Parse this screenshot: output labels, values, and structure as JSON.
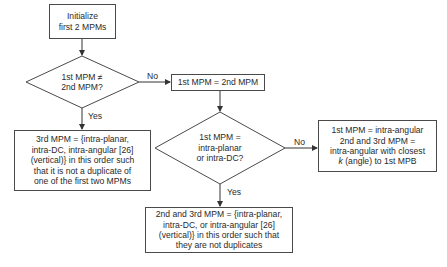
{
  "flowchart": {
    "init_box": {
      "text": "Initialize\nfirst 2 MPMs"
    },
    "decision1": {
      "text": "1st MPM ≠\n2nd MPM?",
      "no_label": "No",
      "yes_label": "Yes"
    },
    "equal_box": {
      "text": "1st MPM = 2nd MPM"
    },
    "third_mpm_box": {
      "text": "3rd MPM = {intra-planar,\nintra-DC, intra-angular [26]\n(vertical)} in this order such\nthat it is not a duplicate of\none of the first two MPMs"
    },
    "decision2": {
      "text": "1st MPM =\nintra-planar\nor intra-DC?",
      "no_label": "No",
      "yes_label": "Yes"
    },
    "angular_box": {
      "line1": "1st MPM = intra-angular",
      "line2": "2nd and 3rd MPM =",
      "line3": "intra-angular with closest",
      "line4_italic": "k",
      "line4_rest": " (angle) to 1st MPB"
    },
    "planar_dc_box": {
      "text": "2nd and 3rd MPM = {intra-planar,\nintra-DC, or intra-angular [26]\n(vertical)} in this order such that\nthey are not duplicates"
    }
  }
}
